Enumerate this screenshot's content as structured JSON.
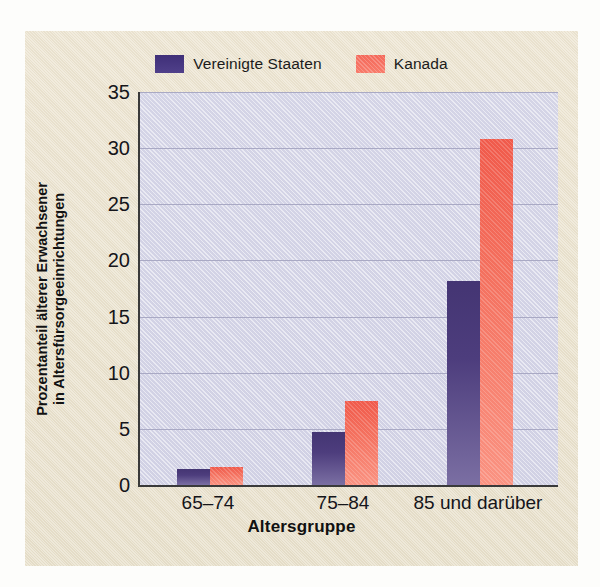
{
  "figure": {
    "background_color": "#e9e1cc",
    "plot_background_color": "#d8d8e9",
    "axis_color": "#3a3a3a",
    "gridline_color": "#a9a9c4"
  },
  "legend": {
    "position": "top-center",
    "entries": [
      {
        "label": "Vereinigte Staaten",
        "color": "#483a7c",
        "swatch": "us"
      },
      {
        "label": "Kanada",
        "color": "#f4715f",
        "swatch": "ca"
      }
    ]
  },
  "axes": {
    "ylabel_line1": "Prozentanteil älterer Erwachsener",
    "ylabel_line2": "in Altersfürsorgeeinrichtungen",
    "xlabel": "Altersgruppe",
    "yticks": [
      "0",
      "5",
      "10",
      "15",
      "20",
      "25",
      "30",
      "35"
    ],
    "xticks": [
      "65–74",
      "75–84",
      "85 und darüber"
    ]
  },
  "chart_data": {
    "type": "bar",
    "title": "",
    "categories": [
      "65–74",
      "75–84",
      "85 und darüber"
    ],
    "series": [
      {
        "name": "Vereinigte Staaten",
        "color": "#483a7c",
        "values": [
          1.4,
          4.7,
          18.2
        ]
      },
      {
        "name": "Kanada",
        "color": "#f4715f",
        "values": [
          1.6,
          7.5,
          30.8
        ]
      }
    ],
    "xlabel": "Altersgruppe",
    "ylabel": "Prozentanteil älterer Erwachsener in Altersfürsorgeeinrichtungen",
    "ylim": [
      0,
      35
    ],
    "ytick_step": 5,
    "grid": true,
    "legend_position": "top-center"
  }
}
